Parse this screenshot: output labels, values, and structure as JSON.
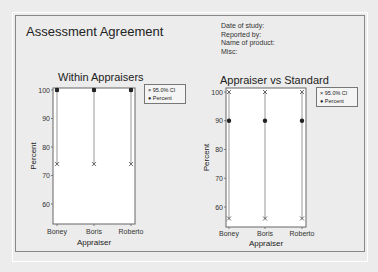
{
  "header": {
    "title": "Assessment Agreement",
    "meta": [
      "Date of study:",
      "Reported by:",
      "Name of product:",
      "Misc:"
    ]
  },
  "legend": {
    "ci": "95.0% CI",
    "percent": "Percent"
  },
  "chart_data": [
    {
      "type": "scatter",
      "title": "Within Appraisers",
      "xlabel": "Appraiser",
      "ylabel": "Percent",
      "categories": [
        "Boney",
        "Boris",
        "Roberto"
      ],
      "series": [
        {
          "name": "Percent",
          "values": [
            100,
            100,
            100
          ]
        },
        {
          "name": "95.0% CI upper",
          "values": [
            100,
            100,
            100
          ]
        },
        {
          "name": "95.0% CI lower",
          "values": [
            74,
            74,
            74
          ]
        }
      ],
      "yticks": [
        60,
        70,
        80,
        90,
        100
      ],
      "ylim": [
        53,
        100.5
      ]
    },
    {
      "type": "scatter",
      "title": "Appraiser vs Standard",
      "xlabel": "Appraiser",
      "ylabel": "Percent",
      "categories": [
        "Boney",
        "Boris",
        "Roberto"
      ],
      "series": [
        {
          "name": "Percent",
          "values": [
            90,
            90,
            90
          ]
        },
        {
          "name": "95.0% CI upper",
          "values": [
            100,
            100,
            100
          ]
        },
        {
          "name": "95.0% CI lower",
          "values": [
            56,
            56,
            56
          ]
        }
      ],
      "yticks": [
        60,
        70,
        80,
        90,
        100
      ],
      "ylim": [
        54,
        101
      ]
    }
  ]
}
